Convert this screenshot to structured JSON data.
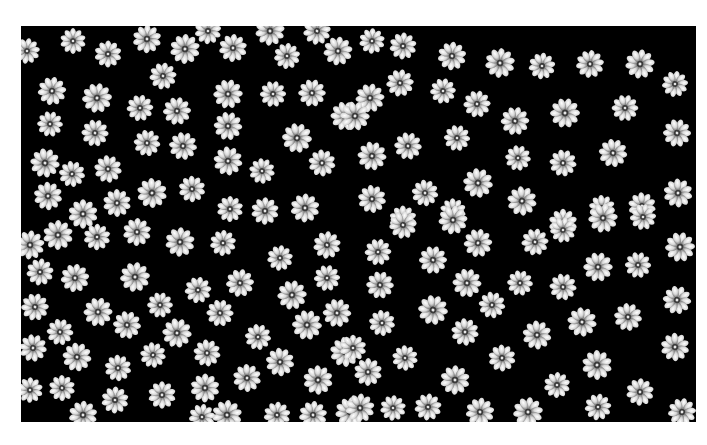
{
  "image": {
    "description": "Microscopy-style image of many flower-shaped particles (about 10 petals each) on a black background inside a white border",
    "background_color": "#ffffff",
    "frame_color": "#000000",
    "particle_color": "#d8d8d8",
    "particle_radius": 14,
    "petal_count": 10,
    "particles": [
      [
        73,
        41
      ],
      [
        108,
        54
      ],
      [
        147,
        39
      ],
      [
        185,
        49
      ],
      [
        208,
        31
      ],
      [
        233,
        48
      ],
      [
        270,
        31
      ],
      [
        287,
        56
      ],
      [
        317,
        31
      ],
      [
        338,
        51
      ],
      [
        27,
        51
      ],
      [
        163,
        76
      ],
      [
        52,
        91
      ],
      [
        97,
        98
      ],
      [
        140,
        108
      ],
      [
        177,
        111
      ],
      [
        228,
        94
      ],
      [
        273,
        94
      ],
      [
        312,
        93
      ],
      [
        345,
        116
      ],
      [
        50,
        124
      ],
      [
        95,
        133
      ],
      [
        228,
        126
      ],
      [
        297,
        138
      ],
      [
        147,
        143
      ],
      [
        183,
        146
      ],
      [
        45,
        163
      ],
      [
        72,
        174
      ],
      [
        108,
        169
      ],
      [
        228,
        161
      ],
      [
        262,
        171
      ],
      [
        322,
        163
      ],
      [
        48,
        196
      ],
      [
        152,
        193
      ],
      [
        192,
        189
      ],
      [
        117,
        203
      ],
      [
        83,
        214
      ],
      [
        230,
        209
      ],
      [
        265,
        211
      ],
      [
        305,
        208
      ],
      [
        372,
        41
      ],
      [
        403,
        46
      ],
      [
        452,
        56
      ],
      [
        500,
        63
      ],
      [
        542,
        66
      ],
      [
        590,
        64
      ],
      [
        640,
        64
      ],
      [
        675,
        84
      ],
      [
        400,
        83
      ],
      [
        370,
        98
      ],
      [
        443,
        91
      ],
      [
        477,
        104
      ],
      [
        515,
        121
      ],
      [
        565,
        113
      ],
      [
        625,
        108
      ],
      [
        677,
        133
      ],
      [
        355,
        116
      ],
      [
        457,
        138
      ],
      [
        408,
        146
      ],
      [
        372,
        156
      ],
      [
        518,
        158
      ],
      [
        563,
        163
      ],
      [
        613,
        153
      ],
      [
        478,
        183
      ],
      [
        425,
        193
      ],
      [
        372,
        199
      ],
      [
        522,
        201
      ],
      [
        602,
        208
      ],
      [
        642,
        206
      ],
      [
        678,
        193
      ],
      [
        453,
        211
      ],
      [
        403,
        219
      ],
      [
        563,
        223
      ],
      [
        58,
        235
      ],
      [
        97,
        237
      ],
      [
        137,
        232
      ],
      [
        180,
        242
      ],
      [
        223,
        243
      ],
      [
        327,
        245
      ],
      [
        30,
        245
      ],
      [
        280,
        258
      ],
      [
        40,
        272
      ],
      [
        75,
        278
      ],
      [
        135,
        277
      ],
      [
        198,
        290
      ],
      [
        240,
        283
      ],
      [
        292,
        295
      ],
      [
        327,
        278
      ],
      [
        35,
        307
      ],
      [
        98,
        312
      ],
      [
        160,
        305
      ],
      [
        220,
        313
      ],
      [
        337,
        313
      ],
      [
        307,
        325
      ],
      [
        60,
        332
      ],
      [
        127,
        325
      ],
      [
        177,
        333
      ],
      [
        258,
        337
      ],
      [
        33,
        348
      ],
      [
        77,
        357
      ],
      [
        153,
        355
      ],
      [
        207,
        353
      ],
      [
        280,
        362
      ],
      [
        345,
        352
      ],
      [
        118,
        368
      ],
      [
        247,
        378
      ],
      [
        318,
        380
      ],
      [
        62,
        388
      ],
      [
        162,
        395
      ],
      [
        205,
        388
      ],
      [
        30,
        390
      ],
      [
        115,
        400
      ],
      [
        83,
        415
      ],
      [
        227,
        415
      ],
      [
        277,
        415
      ],
      [
        313,
        415
      ],
      [
        350,
        412
      ],
      [
        202,
        417
      ],
      [
        403,
        225
      ],
      [
        453,
        220
      ],
      [
        563,
        230
      ],
      [
        535,
        242
      ],
      [
        478,
        243
      ],
      [
        680,
        247
      ],
      [
        378,
        252
      ],
      [
        433,
        260
      ],
      [
        598,
        267
      ],
      [
        638,
        265
      ],
      [
        380,
        285
      ],
      [
        467,
        283
      ],
      [
        520,
        283
      ],
      [
        563,
        287
      ],
      [
        677,
        300
      ],
      [
        433,
        310
      ],
      [
        492,
        305
      ],
      [
        628,
        317
      ],
      [
        582,
        322
      ],
      [
        382,
        323
      ],
      [
        465,
        332
      ],
      [
        537,
        335
      ],
      [
        405,
        358
      ],
      [
        502,
        358
      ],
      [
        675,
        347
      ],
      [
        597,
        365
      ],
      [
        353,
        348
      ],
      [
        368,
        372
      ],
      [
        455,
        380
      ],
      [
        557,
        385
      ],
      [
        640,
        392
      ],
      [
        360,
        408
      ],
      [
        393,
        408
      ],
      [
        428,
        407
      ],
      [
        480,
        412
      ],
      [
        528,
        412
      ],
      [
        598,
        407
      ],
      [
        682,
        412
      ],
      [
        603,
        218
      ],
      [
        643,
        217
      ]
    ]
  }
}
